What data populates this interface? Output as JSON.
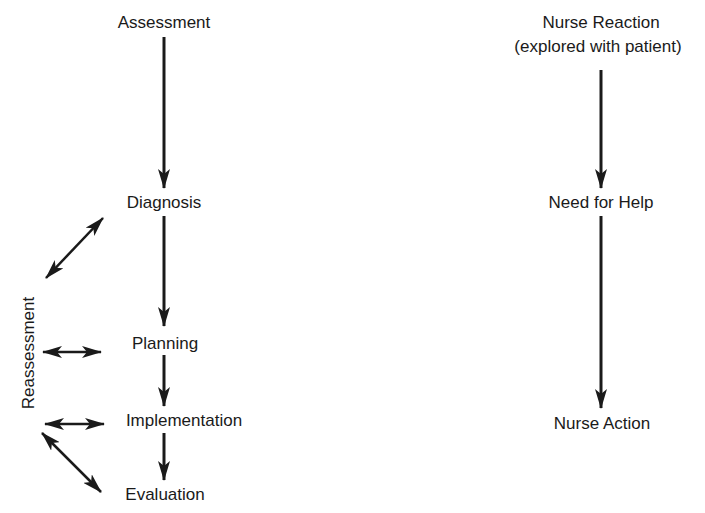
{
  "left_flow": {
    "nodes": [
      {
        "label": "Assessment"
      },
      {
        "label": "Diagnosis"
      },
      {
        "label": "Planning"
      },
      {
        "label": "Implementation"
      },
      {
        "label": "Evaluation"
      }
    ],
    "side_label": "Reassessment"
  },
  "right_flow": {
    "nodes": [
      {
        "label": "Nurse Reaction",
        "sublabel": "(explored with patient)"
      },
      {
        "label": "Need for Help"
      },
      {
        "label": "Nurse Action"
      }
    ]
  },
  "colors": {
    "ink": "#1a1a1a",
    "background": "#ffffff"
  }
}
